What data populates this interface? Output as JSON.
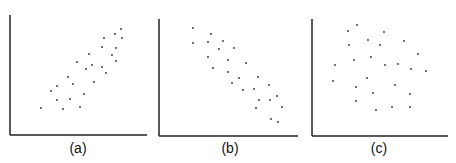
{
  "chart_data": [
    {
      "type": "scatter",
      "title": "",
      "label": "(a)",
      "xlabel": "",
      "ylabel": "",
      "grid": false,
      "legend": null,
      "ticks": "none",
      "description": "positive correlation",
      "axis": {
        "origin_px": [
          10,
          135
        ],
        "x_length_px": 137,
        "y_length_px": 120
      },
      "xlim": [
        0,
        137
      ],
      "ylim": [
        0,
        120
      ],
      "points": [
        [
          31,
          27
        ],
        [
          53,
          26
        ],
        [
          70,
          28
        ],
        [
          47,
          35
        ],
        [
          60,
          36
        ],
        [
          41,
          44
        ],
        [
          47,
          49
        ],
        [
          74,
          41
        ],
        [
          58,
          58
        ],
        [
          63,
          51
        ],
        [
          84,
          53
        ],
        [
          67,
          73
        ],
        [
          76,
          66
        ],
        [
          82,
          70
        ],
        [
          79,
          81
        ],
        [
          92,
          68
        ],
        [
          96,
          62
        ],
        [
          92,
          88
        ],
        [
          94,
          97
        ],
        [
          102,
          80
        ],
        [
          106,
          87
        ],
        [
          106,
          74
        ],
        [
          105,
          101
        ],
        [
          111,
          106
        ],
        [
          112,
          97
        ]
      ]
    },
    {
      "type": "scatter",
      "title": "",
      "label": "(b)",
      "xlabel": "",
      "ylabel": "",
      "grid": false,
      "legend": null,
      "ticks": "none",
      "description": "negative correlation",
      "axis": {
        "origin_px": [
          159,
          136
        ],
        "x_length_px": 139,
        "y_length_px": 117
      },
      "xlim": [
        0,
        139
      ],
      "ylim": [
        0,
        117
      ],
      "points": [
        [
          34,
          108
        ],
        [
          52,
          102
        ],
        [
          34,
          93
        ],
        [
          49,
          94
        ],
        [
          64,
          95
        ],
        [
          60,
          87
        ],
        [
          75,
          88
        ],
        [
          49,
          79
        ],
        [
          69,
          76
        ],
        [
          87,
          73
        ],
        [
          54,
          68
        ],
        [
          69,
          64
        ],
        [
          80,
          58
        ],
        [
          99,
          59
        ],
        [
          73,
          53
        ],
        [
          110,
          51
        ],
        [
          84,
          46
        ],
        [
          95,
          47
        ],
        [
          118,
          40
        ],
        [
          100,
          36
        ],
        [
          111,
          36
        ],
        [
          123,
          29
        ],
        [
          97,
          28
        ],
        [
          112,
          17
        ],
        [
          119,
          14
        ]
      ]
    },
    {
      "type": "scatter",
      "title": "",
      "label": "(c)",
      "xlabel": "",
      "ylabel": "",
      "grid": false,
      "legend": null,
      "ticks": "none",
      "description": "no correlation",
      "axis": {
        "origin_px": [
          312,
          136
        ],
        "x_length_px": 136,
        "y_length_px": 117
      },
      "xlim": [
        0,
        136
      ],
      "ylim": [
        0,
        117
      ],
      "points": [
        [
          45,
          111
        ],
        [
          36,
          105
        ],
        [
          72,
          104
        ],
        [
          56,
          96
        ],
        [
          92,
          95
        ],
        [
          37,
          91
        ],
        [
          68,
          91
        ],
        [
          106,
          82
        ],
        [
          59,
          79
        ],
        [
          42,
          76
        ],
        [
          23,
          71
        ],
        [
          73,
          71
        ],
        [
          86,
          72
        ],
        [
          99,
          67
        ],
        [
          114,
          65
        ],
        [
          55,
          58
        ],
        [
          21,
          55
        ],
        [
          44,
          49
        ],
        [
          83,
          51
        ],
        [
          61,
          43
        ],
        [
          98,
          42
        ],
        [
          44,
          35
        ],
        [
          80,
          29
        ],
        [
          98,
          29
        ],
        [
          64,
          26
        ]
      ]
    }
  ],
  "figure": {
    "labels": [
      "(a)",
      "(b)",
      "(c)"
    ],
    "axis_color": "#222222",
    "point_color": "#333333"
  }
}
